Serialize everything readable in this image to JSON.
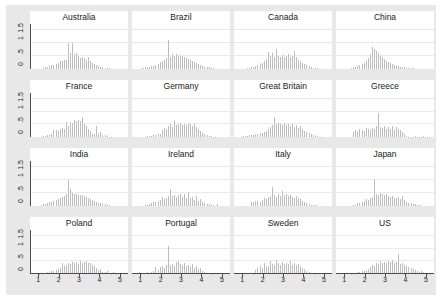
{
  "chart_data": {
    "type": "bar",
    "title": "",
    "subtitle": "",
    "xlabel": "",
    "ylabel": "",
    "xlim": [
      0.6,
      5.4
    ],
    "ylim": [
      0,
      1.75
    ],
    "grid": true,
    "legend": "none",
    "layout": "4x4 small multiples (histogram per country), density on y-axis",
    "y_ticks": [
      "0",
      ".5",
      "1",
      "1.5"
    ],
    "y_tick_values": [
      0,
      0.5,
      1,
      1.5
    ],
    "x_ticks": [
      "1",
      "2",
      "3",
      "4",
      "5"
    ],
    "x_tick_values": [
      1,
      2,
      3,
      4,
      5
    ],
    "bin_width": 0.1,
    "bin_centers": [
      0.65,
      0.75,
      0.85,
      0.95,
      1.05,
      1.15,
      1.25,
      1.35,
      1.45,
      1.55,
      1.65,
      1.75,
      1.85,
      1.95,
      2.05,
      2.15,
      2.25,
      2.35,
      2.45,
      2.55,
      2.65,
      2.75,
      2.85,
      2.95,
      3.05,
      3.15,
      3.25,
      3.35,
      3.45,
      3.55,
      3.65,
      3.75,
      3.85,
      3.95,
      4.05,
      4.15,
      4.25,
      4.35,
      4.45,
      4.55,
      4.65,
      4.75,
      4.85,
      4.95,
      5.05,
      5.15,
      5.25
    ],
    "panels": [
      {
        "title": "Australia",
        "values": [
          0,
          0,
          0,
          0,
          0,
          0,
          0.03,
          0.05,
          0.06,
          0.08,
          0.12,
          0.14,
          0.17,
          0.2,
          0.28,
          0.3,
          0.32,
          0.34,
          1.0,
          0.62,
          1.0,
          0.56,
          0.6,
          0.5,
          0.42,
          0.46,
          0.4,
          0.34,
          0.46,
          0.3,
          0.22,
          0.18,
          0.14,
          0.1,
          0.07,
          0.05,
          0.03,
          0.02,
          0.01,
          0,
          0,
          0,
          0,
          0,
          0,
          0,
          0
        ]
      },
      {
        "title": "Brazil",
        "values": [
          0,
          0,
          0,
          0,
          0.02,
          0.03,
          0.04,
          0.05,
          0.07,
          0.08,
          0.1,
          0.14,
          0.18,
          0.26,
          0.3,
          0.34,
          0.4,
          1.12,
          0.46,
          0.56,
          0.5,
          0.58,
          0.54,
          0.5,
          0.48,
          0.46,
          0.4,
          0.38,
          0.34,
          0.3,
          0.26,
          0.22,
          0.18,
          0.14,
          0.1,
          0.07,
          0.05,
          0.04,
          0.02,
          0.01,
          0,
          0,
          0,
          0,
          0,
          0,
          0
        ]
      },
      {
        "title": "Canada",
        "values": [
          0,
          0,
          0,
          0,
          0,
          0,
          0.02,
          0.03,
          0.05,
          0.07,
          0.1,
          0.13,
          0.18,
          0.22,
          0.28,
          0.36,
          0.64,
          0.5,
          0.62,
          0.44,
          0.76,
          0.48,
          0.46,
          0.52,
          0.44,
          0.5,
          0.56,
          0.46,
          0.5,
          0.68,
          0.44,
          0.32,
          0.26,
          0.2,
          0.16,
          0.12,
          0.08,
          0.05,
          0.03,
          0.02,
          0.01,
          0,
          0,
          0,
          0,
          0,
          0
        ]
      },
      {
        "title": "China",
        "values": [
          0,
          0,
          0,
          0,
          0,
          0,
          0,
          0.02,
          0.04,
          0.06,
          0.08,
          0.12,
          0.16,
          0.22,
          0.3,
          0.42,
          0.56,
          0.84,
          0.76,
          0.68,
          0.62,
          0.5,
          0.44,
          0.36,
          0.3,
          0.24,
          0.2,
          0.16,
          0.13,
          0.1,
          0.08,
          0.06,
          0.05,
          0.04,
          0.03,
          0.02,
          0.01,
          0.01,
          0,
          0,
          0,
          0,
          0,
          0,
          0,
          0,
          0
        ]
      },
      {
        "title": "France",
        "values": [
          0,
          0,
          0,
          0,
          0,
          0.02,
          0.03,
          0.04,
          0.06,
          0.08,
          0.1,
          0.28,
          0.26,
          0.22,
          0.3,
          0.34,
          0.3,
          0.6,
          0.44,
          0.58,
          0.56,
          0.66,
          0.62,
          0.68,
          0.64,
          0.78,
          0.5,
          0.44,
          0.3,
          0.22,
          0.12,
          0.1,
          0.42,
          0.12,
          0.2,
          0.08,
          0.06,
          0.04,
          0.02,
          0.01,
          0,
          0,
          0,
          0,
          0,
          0,
          0
        ]
      },
      {
        "title": "Germany",
        "values": [
          0,
          0,
          0,
          0,
          0,
          0,
          0.02,
          0.03,
          0.04,
          0.05,
          0.06,
          0.08,
          0.1,
          0.12,
          0.28,
          0.34,
          0.3,
          0.44,
          0.52,
          0.38,
          0.62,
          0.46,
          0.5,
          0.54,
          0.48,
          0.52,
          0.46,
          0.56,
          0.5,
          0.44,
          0.52,
          0.4,
          0.3,
          0.24,
          0.14,
          0.1,
          0.06,
          0.04,
          0.03,
          0.02,
          0.01,
          0,
          0,
          0,
          0,
          0,
          0
        ]
      },
      {
        "title": "Great Britain",
        "values": [
          0,
          0,
          0,
          0.02,
          0.03,
          0.04,
          0.05,
          0.06,
          0.08,
          0.09,
          0.1,
          0.12,
          0.14,
          0.16,
          0.2,
          0.24,
          0.3,
          0.38,
          0.46,
          0.8,
          0.52,
          0.56,
          0.5,
          0.48,
          0.54,
          0.46,
          0.5,
          0.44,
          0.52,
          0.4,
          0.46,
          0.34,
          0.42,
          0.3,
          0.24,
          0.18,
          0.14,
          0.1,
          0.07,
          0.05,
          0.03,
          0.02,
          0.01,
          0,
          0,
          0,
          0
        ]
      },
      {
        "title": "Greece",
        "values": [
          0,
          0,
          0,
          0,
          0,
          0,
          0,
          0,
          0.18,
          0.26,
          0.22,
          0.3,
          0.28,
          0.24,
          0.34,
          0.3,
          0.26,
          0.36,
          0.3,
          0.44,
          0.96,
          0.38,
          0.34,
          0.42,
          0.3,
          0.4,
          0.32,
          0.44,
          0.28,
          0.38,
          0.3,
          0.26,
          0.2,
          0.1,
          0.04,
          0.02,
          0.01,
          0.02,
          0.03,
          0.02,
          0.01,
          0.02,
          0.03,
          0.02,
          0.01,
          0,
          0
        ]
      },
      {
        "title": "India",
        "values": [
          0,
          0,
          0,
          0,
          0,
          0.02,
          0.04,
          0.06,
          0.09,
          0.12,
          0.15,
          0.18,
          0.22,
          0.26,
          0.3,
          0.34,
          0.38,
          0.44,
          1.0,
          0.66,
          0.5,
          0.46,
          0.44,
          0.42,
          0.4,
          0.42,
          0.38,
          0.34,
          0.3,
          0.26,
          0.22,
          0.18,
          0.14,
          0.1,
          0.08,
          0.06,
          0.04,
          0.02,
          0.01,
          0,
          0,
          0,
          0,
          0,
          0,
          0,
          0
        ]
      },
      {
        "title": "Ireland",
        "values": [
          0,
          0,
          0,
          0,
          0,
          0,
          0.02,
          0.03,
          0.06,
          0.1,
          0.14,
          0.12,
          0.16,
          0.2,
          0.34,
          0.24,
          0.3,
          0.38,
          0.66,
          0.36,
          0.42,
          0.34,
          0.4,
          0.46,
          0.32,
          0.44,
          0.3,
          0.52,
          0.28,
          0.34,
          0.22,
          0.36,
          0.18,
          0.24,
          0.14,
          0.1,
          0.06,
          0.04,
          0.02,
          0.01,
          0,
          0.04,
          0,
          0,
          0,
          0,
          0
        ]
      },
      {
        "title": "Italy",
        "values": [
          0,
          0,
          0,
          0,
          0,
          0,
          0,
          0,
          0.12,
          0.14,
          0.16,
          0.18,
          0.14,
          0.22,
          0.3,
          0.24,
          0.34,
          0.38,
          0.74,
          0.42,
          0.34,
          0.46,
          0.38,
          0.56,
          0.4,
          0.44,
          0.36,
          0.42,
          0.34,
          0.3,
          0.36,
          0.28,
          0.24,
          0.18,
          0.12,
          0.08,
          0.05,
          0.03,
          0.02,
          0.01,
          0,
          0,
          0,
          0,
          0,
          0,
          0
        ]
      },
      {
        "title": "Japan",
        "values": [
          0,
          0,
          0,
          0,
          0,
          0,
          0,
          0,
          0.02,
          0.01,
          0.08,
          0.1,
          0.14,
          0.18,
          0.24,
          0.22,
          0.28,
          0.32,
          1.06,
          0.46,
          0.42,
          0.5,
          0.44,
          0.4,
          0.46,
          0.38,
          0.34,
          0.36,
          0.3,
          0.28,
          0.32,
          0.24,
          0.38,
          0.22,
          0.14,
          0.08,
          0.1,
          0.06,
          0.04,
          0.02,
          0.01,
          0,
          0,
          0,
          0,
          0,
          0
        ]
      },
      {
        "title": "Poland",
        "values": [
          0,
          0,
          0,
          0,
          0.02,
          0.04,
          0.03,
          0.05,
          0.06,
          0.08,
          0.1,
          0.12,
          0.14,
          0.18,
          0.22,
          0.42,
          0.3,
          0.34,
          0.44,
          0.38,
          0.46,
          0.42,
          0.48,
          0.4,
          0.5,
          0.44,
          0.46,
          0.52,
          0.42,
          0.44,
          0.36,
          0.3,
          0.22,
          0.14,
          0.2,
          0.08,
          0.06,
          0.1,
          0.04,
          0.02,
          0.06,
          0.01,
          0,
          0,
          0,
          0,
          0
        ]
      },
      {
        "title": "Portugal",
        "values": [
          0,
          0,
          0,
          0.06,
          0.02,
          0.03,
          0.04,
          0.06,
          0.05,
          0.08,
          0.1,
          0.26,
          0.14,
          0.28,
          0.32,
          0.22,
          0.36,
          1.12,
          0.34,
          0.4,
          0.3,
          0.46,
          0.52,
          0.38,
          0.34,
          0.42,
          0.3,
          0.36,
          0.28,
          0.4,
          0.24,
          0.3,
          0.18,
          0.22,
          0.12,
          0.08,
          0.05,
          0.03,
          0.02,
          0.01,
          0,
          0,
          0,
          0,
          0,
          0,
          0
        ]
      },
      {
        "title": "Sweden",
        "values": [
          0,
          0,
          0,
          0,
          0,
          0,
          0,
          0,
          0.04,
          0.02,
          0.14,
          0.22,
          0.3,
          0.24,
          0.42,
          0.28,
          0.32,
          0.52,
          0.38,
          0.34,
          0.56,
          0.42,
          0.36,
          0.48,
          0.38,
          0.44,
          0.4,
          0.5,
          0.36,
          0.42,
          0.34,
          0.38,
          0.3,
          0.24,
          0.18,
          0.12,
          0.08,
          0.04,
          0.02,
          0.01,
          0,
          0,
          0,
          0,
          0,
          0,
          0
        ]
      },
      {
        "title": "US",
        "values": [
          0,
          0,
          0,
          0,
          0,
          0,
          0,
          0.02,
          0.03,
          0.04,
          0.06,
          0.08,
          0.1,
          0.12,
          0.16,
          0.2,
          0.26,
          0.34,
          0.3,
          0.44,
          0.4,
          0.52,
          0.42,
          0.48,
          0.44,
          0.5,
          0.46,
          0.54,
          0.42,
          0.48,
          0.8,
          0.4,
          0.44,
          0.34,
          0.3,
          0.26,
          0.22,
          0.18,
          0.14,
          0.1,
          0.08,
          0.12,
          0.06,
          0.04,
          0.02,
          0.01,
          0
        ]
      }
    ]
  },
  "colors": {
    "background": "#e8e8e8",
    "panel": "#ffffff",
    "bar": "#bdbdbd",
    "axis": "#4d4d4d",
    "gridline": "#e9e9e9",
    "text": "#1a1a1a"
  }
}
